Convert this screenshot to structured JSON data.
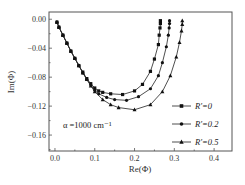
{
  "chart_data": {
    "type": "line",
    "title": "",
    "xlabel": "Re(Φ)",
    "ylabel": "Im(Φ)",
    "xlim": [
      -0.015,
      0.445
    ],
    "ylim": [
      -0.182,
      0.01
    ],
    "xticks": [
      0.0,
      0.1,
      0.2,
      0.3,
      0.4
    ],
    "xtick_labels": [
      "0.0",
      "0.1",
      "0.2",
      "0.3",
      "0.4"
    ],
    "yticks": [
      0.0,
      -0.04,
      -0.08,
      -0.12,
      -0.16
    ],
    "ytick_labels": [
      "0.00",
      "−0.04",
      "−0.08",
      "−0.12",
      "−0.16"
    ],
    "grid": false,
    "legend_position": "lower right",
    "annotation": "α =1000 cm⁻¹",
    "series": [
      {
        "name": "R′=0",
        "legend_label": "R′=0",
        "marker": "square",
        "x": [
          0.005,
          0.01,
          0.02,
          0.03,
          0.04,
          0.05,
          0.06,
          0.07,
          0.08,
          0.09,
          0.1,
          0.11,
          0.12,
          0.14,
          0.17,
          0.2,
          0.22,
          0.24,
          0.25,
          0.26,
          0.262,
          0.264,
          0.265,
          0.265
        ],
        "y": [
          -0.004,
          -0.011,
          -0.022,
          -0.033,
          -0.044,
          -0.054,
          -0.064,
          -0.073,
          -0.082,
          -0.089,
          -0.095,
          -0.099,
          -0.101,
          -0.103,
          -0.104,
          -0.099,
          -0.09,
          -0.072,
          -0.055,
          -0.035,
          -0.022,
          -0.012,
          -0.006,
          -0.002
        ]
      },
      {
        "name": "R′=0.2",
        "legend_label": "R′=0.2",
        "marker": "circle",
        "x": [
          0.005,
          0.01,
          0.02,
          0.03,
          0.04,
          0.05,
          0.06,
          0.07,
          0.08,
          0.09,
          0.1,
          0.11,
          0.13,
          0.15,
          0.18,
          0.21,
          0.24,
          0.26,
          0.27,
          0.28,
          0.285,
          0.287,
          0.288,
          0.288
        ],
        "y": [
          -0.004,
          -0.011,
          -0.022,
          -0.033,
          -0.044,
          -0.054,
          -0.064,
          -0.074,
          -0.083,
          -0.091,
          -0.098,
          -0.103,
          -0.108,
          -0.111,
          -0.112,
          -0.107,
          -0.096,
          -0.078,
          -0.06,
          -0.038,
          -0.022,
          -0.012,
          -0.006,
          -0.002
        ]
      },
      {
        "name": "R′=0.5",
        "legend_label": "R′=0.5",
        "marker": "triangle",
        "x": [
          0.005,
          0.01,
          0.02,
          0.03,
          0.04,
          0.05,
          0.06,
          0.07,
          0.08,
          0.09,
          0.1,
          0.12,
          0.14,
          0.16,
          0.2,
          0.24,
          0.27,
          0.29,
          0.305,
          0.313,
          0.318,
          0.32,
          0.32
        ],
        "y": [
          -0.004,
          -0.011,
          -0.022,
          -0.033,
          -0.044,
          -0.054,
          -0.064,
          -0.074,
          -0.083,
          -0.092,
          -0.1,
          -0.111,
          -0.118,
          -0.122,
          -0.125,
          -0.118,
          -0.1,
          -0.078,
          -0.052,
          -0.032,
          -0.016,
          -0.007,
          -0.002
        ]
      }
    ]
  }
}
